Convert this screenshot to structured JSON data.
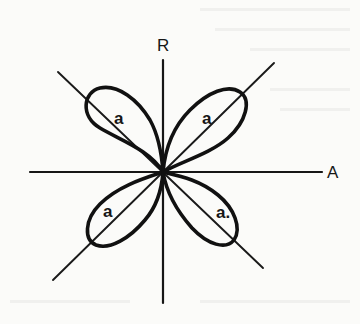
{
  "diagram": {
    "type": "polar-lobe-pattern",
    "axes": {
      "vertical_label": "R",
      "horizontal_label": "A"
    },
    "lobes": [
      {
        "id": "upper-left",
        "label": "a"
      },
      {
        "id": "upper-right",
        "label": "a"
      },
      {
        "id": "lower-left",
        "label": "a"
      },
      {
        "id": "lower-right",
        "label": "a."
      }
    ],
    "colors": {
      "ink": "#111111",
      "paper": "#fbfbf9"
    }
  }
}
